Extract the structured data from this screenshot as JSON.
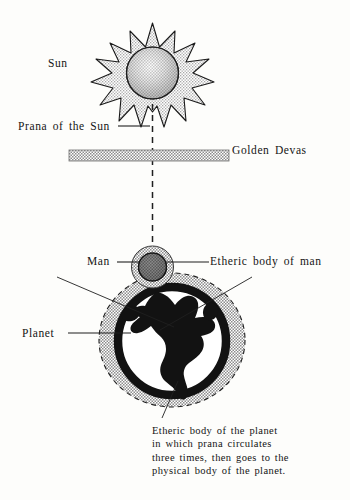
{
  "diagram": {
    "background_color": "#fdfdfb",
    "ink_color": "#141414",
    "stipple_color": "#9a9a9a",
    "labels": {
      "sun": "Sun",
      "prana_of_the_sun": "Prana of the Sun",
      "golden_devas": "Golden Devas",
      "man": "Man",
      "etheric_body_of_man": "Etheric body of man",
      "planet": "Planet"
    },
    "caption_etheric_body_of_planet": {
      "line1": "Etheric body of the planet",
      "line2": "in which prana circulates",
      "line3": "three times, then goes to the",
      "line4": "physical body of the planet."
    },
    "elements": {
      "sun_rays_count": 12,
      "prana_line_style": "dashed",
      "devas_band_fill": "stipple",
      "man_aura_fill": "stipple",
      "planet_aura_fill": "stipple",
      "planet_aura_border": "dashed",
      "planet_continents": "Americas"
    }
  }
}
